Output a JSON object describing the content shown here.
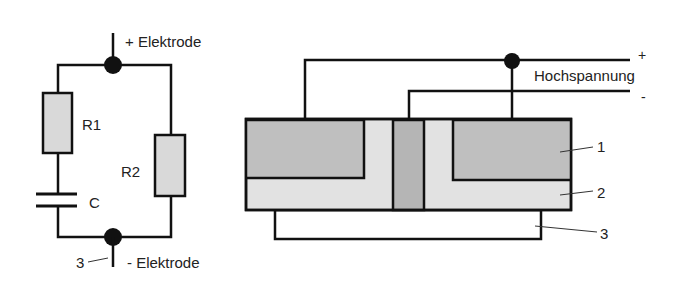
{
  "colors": {
    "line": "#111111",
    "electrode_fill": "#bfbfbf",
    "dielectric_fill": "#e2e2e2",
    "center_fill": "#b5b5b5",
    "resistor_fill": "#d9d9d9",
    "background": "#ffffff",
    "text": "#222222"
  },
  "circuit": {
    "plus_electrode_label": "+ Elektrode",
    "minus_electrode_label": "- Elektrode",
    "r1_label": "R1",
    "r2_label": "R2",
    "capacitor_label": "C",
    "terminal_number": "3"
  },
  "cross_section": {
    "plus_label": "+",
    "hochspannung_label": "Hochspannung",
    "minus_label": "-",
    "callouts": [
      {
        "number": "1"
      },
      {
        "number": "2"
      },
      {
        "number": "3"
      }
    ]
  }
}
